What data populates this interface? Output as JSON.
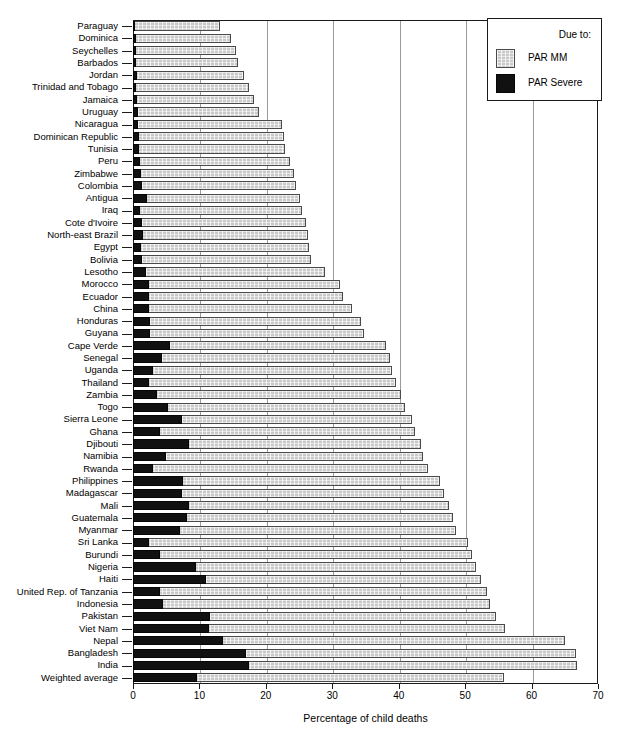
{
  "chart_data": {
    "type": "bar",
    "orientation": "horizontal",
    "stacked": true,
    "title": "",
    "xlabel": "Percentage of child deaths",
    "ylabel": "",
    "xlim": [
      0,
      70
    ],
    "xticks": [
      0,
      10,
      20,
      30,
      40,
      50,
      60,
      70
    ],
    "grid": "vertical",
    "legend": {
      "title": "Due to:",
      "position": "top-right",
      "entries": [
        {
          "name": "PAR  MM",
          "swatch": "mm"
        },
        {
          "name": "PAR Severe",
          "swatch": "sev"
        }
      ]
    },
    "series": [
      {
        "name": "PAR Severe",
        "key": "severe",
        "color": "#111111"
      },
      {
        "name": "PAR  MM",
        "key": "mm",
        "color": "#c9c9c9"
      }
    ],
    "categories": [
      "Paraguay",
      "Dominica",
      "Seychelles",
      "Barbados",
      "Jordan",
      "Trinidad and Tobago",
      "Jamaica",
      "Uruguay",
      "Nicaragua",
      "Dominican Republic",
      "Tunisia",
      "Peru",
      "Zimbabwe",
      "Colombia",
      "Antigua",
      "Iraq",
      "Cote d'Ivoire",
      "North-east Brazil",
      "Egypt",
      "Bolivia",
      "Lesotho",
      "Morocco",
      "Ecuador",
      "China",
      "Honduras",
      "Guyana",
      "Cape Verde",
      "Senegal",
      "Uganda",
      "Thailand",
      "Zambia",
      "Togo",
      "Sierra Leone",
      "Ghana",
      "Djibouti",
      "Namibia",
      "Rwanda",
      "Philippines",
      "Madagascar",
      "Mali",
      "Guatemala",
      "Myanmar",
      "Sri Lanka",
      "Burundi",
      "Nigeria",
      "Haiti",
      "United Rep. of Tanzania",
      "Indonesia",
      "Pakistan",
      "Viet Nam",
      "Nepal",
      "Bangladesh",
      "India",
      "Weighted average"
    ],
    "severe_values": [
      0.3,
      0.4,
      0.5,
      0.5,
      0.6,
      0.5,
      0.6,
      0.7,
      0.8,
      0.9,
      0.9,
      1.0,
      1.2,
      1.3,
      2.1,
      1.1,
      1.3,
      1.5,
      1.2,
      1.4,
      2.0,
      2.4,
      2.4,
      2.4,
      2.5,
      2.6,
      5.6,
      4.4,
      3.0,
      2.4,
      3.6,
      5.2,
      7.4,
      4.0,
      8.4,
      5.0,
      3.0,
      7.5,
      7.4,
      8.5,
      8.2,
      7.1,
      2.4,
      4.0,
      9.5,
      11.0,
      4.0,
      4.5,
      11.6,
      11.5,
      13.5,
      17.0,
      17.5,
      9.7
    ],
    "total_values": [
      13.1,
      14.7,
      15.5,
      15.8,
      16.7,
      17.5,
      18.2,
      19.0,
      22.4,
      22.8,
      22.9,
      23.6,
      24.3,
      24.5,
      25.2,
      25.5,
      26.0,
      26.3,
      26.5,
      26.8,
      28.9,
      31.1,
      31.6,
      33.0,
      34.3,
      34.8,
      38.1,
      38.7,
      39.0,
      39.6,
      40.3,
      41.0,
      42.0,
      42.5,
      43.3,
      43.6,
      44.4,
      46.2,
      46.8,
      47.5,
      48.2,
      48.6,
      50.4,
      51.1,
      51.6,
      52.4,
      53.3,
      53.8,
      54.6,
      56.0,
      65.0,
      66.7,
      66.9,
      55.8
    ]
  },
  "axis": {
    "x_title": "Percentage of child deaths",
    "tick_labels": [
      "0",
      "10",
      "20",
      "30",
      "40",
      "50",
      "60",
      "70"
    ]
  },
  "legend": {
    "title": "Due to:",
    "item_mm": "PAR  MM",
    "item_severe": "PAR Severe"
  }
}
